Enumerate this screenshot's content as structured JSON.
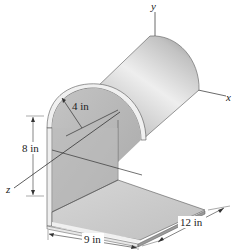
{
  "diagram": {
    "type": "3d-engineering-figure",
    "axes": {
      "x": "x",
      "y": "y",
      "z": "z"
    },
    "dimensions": {
      "radius": "4 in",
      "height": "8 in",
      "base_width": "9 in",
      "depth": "12 in"
    },
    "colors": {
      "shell_light": "#e6e6e6",
      "shell_mid": "#bdbdbd",
      "shell_dark": "#8a8a8a",
      "inner_face": "#b8b8b8",
      "base_top": "#cfcfcf",
      "edge_highlight": "#f2f2f2",
      "line": "#333333"
    }
  }
}
